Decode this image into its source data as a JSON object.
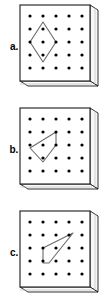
{
  "figure": {
    "kind": "geoboard-diagram",
    "panel_count": 3,
    "grid": {
      "rows": 5,
      "cols": 5,
      "pin_count": 25
    },
    "colors": {
      "pin": "#000000",
      "band": "#5a5a5a",
      "board_face": "#ffffff",
      "board_outline": "#1a1a1a",
      "board_side": "#f2f2f2",
      "label": "#000000"
    }
  },
  "panels": [
    {
      "id": "a",
      "label": "a.",
      "shape_name": "diamond",
      "vertex_count": 4,
      "vertices_grid": [
        [
          2,
          1
        ],
        [
          1,
          2
        ],
        [
          2,
          3
        ],
        [
          3,
          2
        ]
      ],
      "contains_pin": true
    },
    {
      "id": "b",
      "label": "b.",
      "shape_name": "quadrilateral",
      "vertex_count": 4,
      "vertices_grid": [
        [
          3,
          1
        ],
        [
          0,
          2
        ],
        [
          1.5,
          3
        ],
        [
          3,
          2
        ]
      ],
      "contains_pin": true
    },
    {
      "id": "c",
      "label": "c.",
      "shape_name": "quadrilateral",
      "vertex_count": 4,
      "vertices_grid": [
        [
          1,
          2
        ],
        [
          4,
          1
        ],
        [
          2,
          3.2
        ],
        [
          1,
          3.2
        ]
      ],
      "contains_pin": true
    }
  ]
}
